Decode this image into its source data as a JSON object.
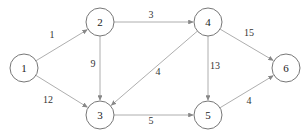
{
  "diagram": {
    "type": "directed-weighted-graph",
    "nodes": [
      {
        "id": "1",
        "label": "1",
        "x": 24,
        "y": 68
      },
      {
        "id": "2",
        "label": "2",
        "x": 100,
        "y": 22
      },
      {
        "id": "3",
        "label": "3",
        "x": 100,
        "y": 115
      },
      {
        "id": "4",
        "label": "4",
        "x": 208,
        "y": 22
      },
      {
        "id": "5",
        "label": "5",
        "x": 208,
        "y": 115
      },
      {
        "id": "6",
        "label": "6",
        "x": 286,
        "y": 68
      }
    ],
    "edges": [
      {
        "from": "1",
        "to": "2",
        "weight": "1",
        "lx": 52,
        "ly": 38
      },
      {
        "from": "1",
        "to": "3",
        "weight": "12",
        "lx": 48,
        "ly": 103
      },
      {
        "from": "2",
        "to": "4",
        "weight": "3",
        "lx": 151,
        "ly": 18
      },
      {
        "from": "2",
        "to": "3",
        "weight": "9",
        "lx": 93,
        "ly": 67
      },
      {
        "from": "4",
        "to": "3",
        "weight": "4",
        "lx": 158,
        "ly": 75
      },
      {
        "from": "3",
        "to": "5",
        "weight": "5",
        "lx": 151,
        "ly": 124
      },
      {
        "from": "4",
        "to": "5",
        "weight": "13",
        "lx": 215,
        "ly": 69
      },
      {
        "from": "4",
        "to": "6",
        "weight": "15",
        "lx": 249,
        "ly": 36
      },
      {
        "from": "5",
        "to": "6",
        "weight": "4",
        "lx": 249,
        "ly": 104
      }
    ]
  }
}
